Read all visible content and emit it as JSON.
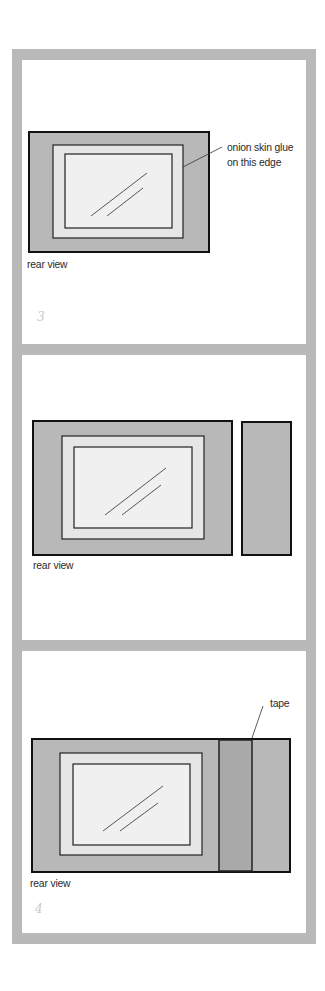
{
  "colors": {
    "frame_border": "#b9b9b9",
    "panel_bg": "#ffffff",
    "frame_fill": "#b8b8b8",
    "mat_fill": "#e6e6e6",
    "photo_fill": "#f0f0f0",
    "tape_fill": "#a9a9a9",
    "outline": "#111111",
    "text": "#2a2a2a",
    "page_number": "#c9c9c9"
  },
  "panels": [
    {
      "step": 1,
      "view_label": "rear view",
      "annotation": {
        "line1": "onion skin glue",
        "line2": "on this edge"
      },
      "page_number": "3"
    },
    {
      "step": 2,
      "view_label": "rear view",
      "side_piece": true
    },
    {
      "step": 3,
      "view_label": "rear view",
      "annotation": {
        "line1": "tape"
      },
      "page_number": "4"
    }
  ]
}
